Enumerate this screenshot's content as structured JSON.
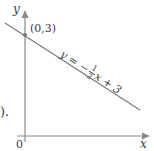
{
  "diagram": {
    "axes": {
      "x_label": "x",
      "y_label": "y",
      "origin_label": "0"
    },
    "point": {
      "label": "(0,3)",
      "x": 0,
      "y": 3
    },
    "line": {
      "equation_prefix": "y = −",
      "frac_num": "1",
      "frac_den": "2",
      "equation_suffix": "x + 3",
      "slope": -0.5,
      "intercept": 3
    },
    "cut_text": ")."
  },
  "colors": {
    "axis": "#8a8a8a",
    "line": "#7a7a7a",
    "point": "#7a7a7a",
    "text": "#3a3a3a"
  }
}
